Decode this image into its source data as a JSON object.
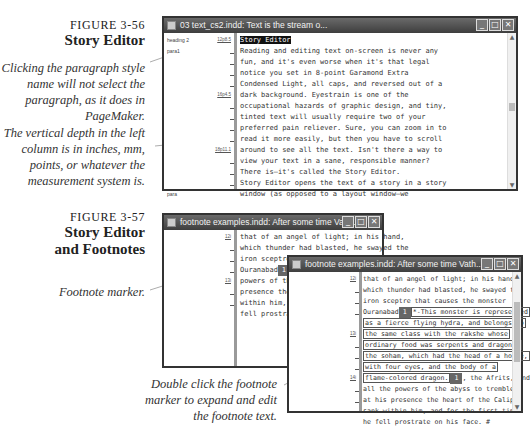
{
  "figure1": {
    "number": "FIGURE 3-56",
    "title": "Story Editor",
    "captions": [
      "Clicking the paragraph style name will not select the paragraph, as it does in PageMaker.",
      "The vertical depth in the left column is in inches, mm, points, or whatever the measurement system is."
    ],
    "window": {
      "title": "03 text_cs2.indd: Text is the stream o...",
      "buttons": {
        "minimize": "_",
        "maximize": "□",
        "close": "✕"
      },
      "styles": [
        "heading 2",
        "para1",
        "para"
      ],
      "depths": [
        "12p8.5",
        "16p4.5",
        "18p11.1"
      ],
      "lines": [
        "Story Editor",
        "Reading and editing text on-screen is never any",
        "fun, and it's even worse when it's that legal",
        "notice you set in 8-point Garamond Extra",
        "Condensed Light, all caps, and reversed out of a",
        "dark background. Eyestrain is one of the",
        "occupational hazards of graphic design, and tiny,",
        "tinted text will usually require two of your",
        "preferred pain reliever. Sure, you can zoom in to",
        "read it more easily, but then you have to scroll",
        "around to see all the text. Isn't there a way to",
        "view your text in a sane, responsible manner?",
        "There is—it's called the Story Editor.",
        "Story Editor opens the text of a story in a story",
        "window (as opposed to a layout window—we"
      ]
    }
  },
  "figure2": {
    "number": "FIGURE 3-57",
    "title_lines": [
      "Story Editor",
      "and Footnotes"
    ],
    "captions": {
      "marker": "Footnote marker.",
      "expand": "Double click the footnote marker to expand and edit the footnote text."
    },
    "back_window": {
      "title": "footnote examples.indd: After some time Vath...",
      "depths": [
        "12i",
        "13i"
      ],
      "lines": [
        "that of an angel of light; in his hand,",
        "which thunder had blasted, he swayed the",
        "iron sceptre that causes the monster",
        "Ouranabad",
        "powers of the a",
        "presence the he",
        "within him, and",
        "fell prostrate"
      ],
      "footnote_marker": "1"
    },
    "front_window": {
      "title": "footnote examples.indd: After some time Vath...",
      "depths": [
        "12i",
        "13i",
        "14i"
      ],
      "lines_before": [
        "that of an angel of light; in his hand,",
        "which thunder had blasted, he swayed the",
        "iron sceptre that causes the monster"
      ],
      "marker_line_prefix": "Ouranabad",
      "footnote_lines": [
        "*-This monster is represented",
        "as a fierce flying hydra, and belongs to",
        "the same class with the rakshe whose",
        "ordinary food was serpents and dragons;",
        "the soham, which had the head of a horse,",
        "with four eyes, and the body of a",
        "flame-colored dragon."
      ],
      "after_marker": ", the Afrits, and",
      "lines_after": [
        "all the powers of the abyss to tremble;",
        "at his presence the heart of the Caliph",
        "sank within him, and for the first time",
        "he fell prostrate on his face. #"
      ],
      "footnote_marker": "1"
    }
  }
}
